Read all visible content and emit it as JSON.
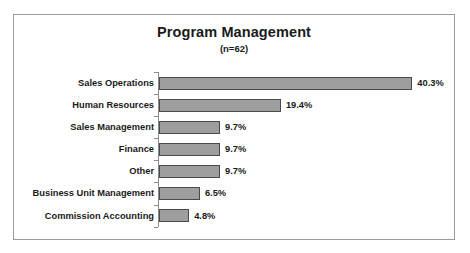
{
  "chart_data": {
    "type": "bar",
    "orientation": "horizontal",
    "title": "Program Management",
    "subtitle": "(n=62)",
    "xlabel": "",
    "ylabel": "",
    "sample_size": 62,
    "grid": false,
    "legend": "none",
    "axis_line": "vertical-left",
    "value_suffix": "%",
    "xlim": [
      0,
      42
    ],
    "categories": [
      "Sales Operations",
      "Human Resources",
      "Sales Management",
      "Finance",
      "Other",
      "Business Unit Management",
      "Commission Accounting"
    ],
    "values": [
      40.3,
      19.4,
      9.7,
      9.7,
      9.7,
      6.5,
      4.8
    ],
    "value_labels": [
      "40.3%",
      "19.4%",
      "9.7%",
      "9.7%",
      "9.7%",
      "6.5%",
      "4.8%"
    ],
    "colors": {
      "bar_fill": "#9e9e9e",
      "bar_border": "#4a4a4a",
      "axis": "#8c8c8c",
      "frame": "#9a9a9a",
      "text": "#1a1a1a",
      "background": "#ffffff"
    }
  }
}
